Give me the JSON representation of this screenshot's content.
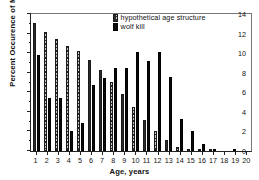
{
  "chart_data": {
    "type": "bar",
    "title": "",
    "xlabel": "Age, years",
    "ylabel": "Percent Occurence of Moose",
    "ylim": [
      0,
      14
    ],
    "yticks": [
      0,
      2,
      4,
      6,
      8,
      10,
      12,
      14
    ],
    "ytick_labels": [
      "0",
      "2",
      "4",
      "6",
      "8",
      "10",
      "12",
      "14"
    ],
    "grid": false,
    "legend_position": "top-right-inside",
    "categories": [
      "1",
      "2",
      "3",
      "4",
      "5",
      "6",
      "7",
      "8",
      "9",
      "10",
      "11",
      "12",
      "13",
      "14",
      "15",
      "16",
      "17",
      "18",
      "19",
      "20"
    ],
    "series": [
      {
        "name": "hypothetical age structure",
        "swatch": "hyp",
        "color": "#c9c9c9",
        "values": [
          13.1,
          12.2,
          11.4,
          10.7,
          10.2,
          9.3,
          8.3,
          7.1,
          5.8,
          4.5,
          3.2,
          2.0,
          1.1,
          0.45,
          0.2,
          0.12,
          0.08,
          0.0,
          0.0,
          0.0
        ]
      },
      {
        "name": "wolf kill",
        "swatch": "kill",
        "color": "#0a0a0a",
        "values": [
          9.8,
          5.4,
          5.4,
          2.0,
          2.85,
          6.75,
          7.5,
          8.45,
          8.5,
          10.1,
          9.15,
          10.1,
          7.55,
          3.3,
          2.0,
          0.7,
          0.2,
          0.0,
          0.25,
          0.0
        ]
      }
    ]
  }
}
